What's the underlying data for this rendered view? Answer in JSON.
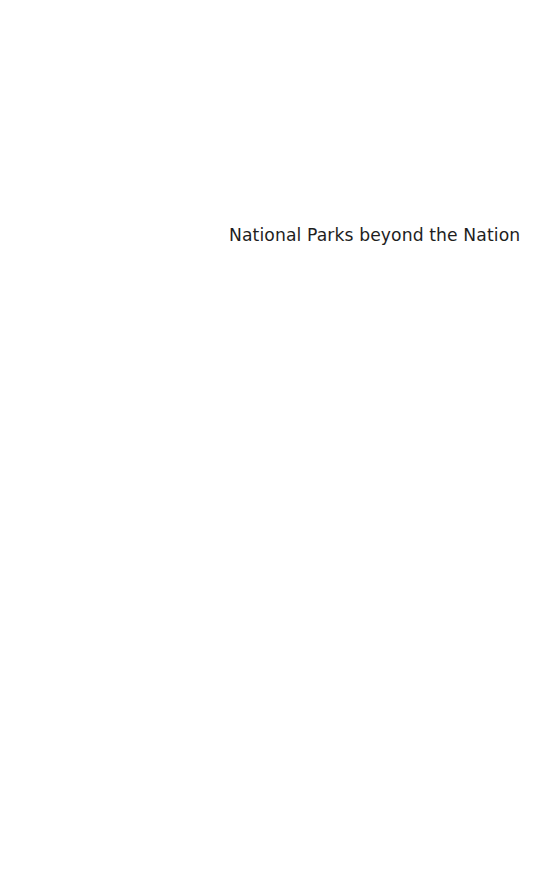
{
  "page": {
    "type": "half-title",
    "title": "National Parks beyond the Nation"
  }
}
